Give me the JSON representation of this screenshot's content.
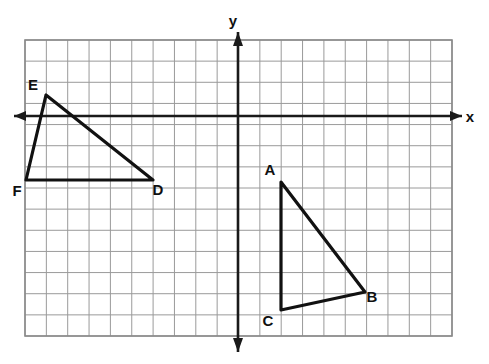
{
  "figure": {
    "background_color": "#ffffff",
    "grid": {
      "line_color": "#9a9a9a",
      "border_color": "#8a8a8a",
      "columns": 20,
      "rows": 14,
      "cell_size_px": 21.35,
      "left_px": 25,
      "top_px": 40,
      "right_px": 452,
      "bottom_px": 336
    },
    "axes": {
      "color": "#1a1a1a",
      "origin_px": {
        "x": 238,
        "y": 116
      },
      "x_axis": {
        "label": "x",
        "label_x_px": 468,
        "label_y_px": 117
      },
      "y_axis": {
        "label": "y",
        "label_x_px": 232,
        "label_y_px": 28
      }
    }
  },
  "chart_data": {
    "type": "scatter",
    "xlabel": "x",
    "ylabel": "y",
    "xlim": [
      -10,
      10
    ],
    "ylim": [
      -10.4,
      3.6
    ],
    "grid": true,
    "legend": null,
    "shapes": [
      {
        "name": "triangle-def",
        "type": "polygon",
        "vertices": [
          {
            "label": "D",
            "x": -4,
            "y": -3,
            "px": 153,
            "py": 180,
            "label_px": 158,
            "label_py": 195
          },
          {
            "label": "E",
            "x": -9,
            "y": 1,
            "px": 46,
            "py": 95,
            "label_px": 33,
            "label_py": 90
          },
          {
            "label": "F",
            "x": -10,
            "y": -3,
            "px": 26,
            "py": 180,
            "label_px": 17,
            "label_py": 196
          }
        ]
      },
      {
        "name": "triangle-abc",
        "type": "polygon",
        "vertices": [
          {
            "label": "A",
            "x": 2,
            "y": -3.1,
            "px": 281,
            "py": 182,
            "label_px": 270,
            "label_py": 175
          },
          {
            "label": "B",
            "x": 6,
            "y": -8.3,
            "px": 365,
            "py": 292,
            "label_px": 372,
            "label_py": 302
          },
          {
            "label": "C",
            "x": 2,
            "y": -9.2,
            "px": 281,
            "py": 310,
            "label_px": 268,
            "label_py": 326
          }
        ]
      }
    ]
  },
  "labels": {
    "a": "A",
    "b": "B",
    "c": "C",
    "d": "D",
    "e": "E",
    "f": "F",
    "x_axis": "x",
    "y_axis": "y"
  }
}
